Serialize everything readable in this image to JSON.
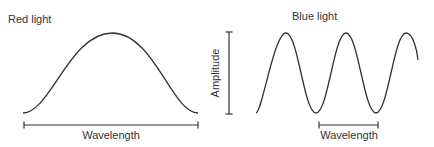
{
  "diagram": {
    "left_panel": {
      "title": "Red light",
      "wavelength_label": "Wavelength"
    },
    "right_panel": {
      "title": "Blue light",
      "amplitude_label": "Amplitude",
      "wavelength_label": "Wavelength"
    },
    "colors": {
      "stroke": "#333333",
      "background": "#ffffff"
    }
  }
}
